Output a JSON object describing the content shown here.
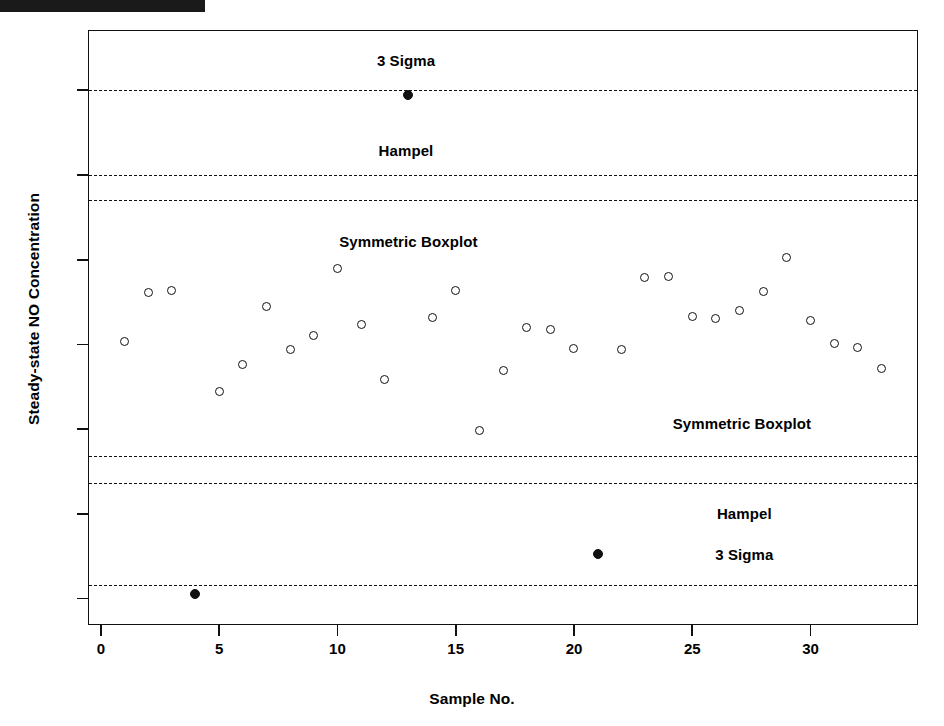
{
  "chart_data": {
    "type": "scatter",
    "title": "",
    "xlabel": "Sample No.",
    "ylabel": "Steady-state NO Concentration",
    "xlim": [
      -0.5,
      34.5
    ],
    "ylim": [
      -600,
      13400
    ],
    "xticks": [
      0,
      5,
      10,
      15,
      20,
      25,
      30
    ],
    "yticks": [
      0,
      2000,
      4000,
      6000,
      8000,
      10000,
      12000
    ],
    "grid": false,
    "legend": "none",
    "x": [
      1,
      2,
      3,
      4,
      5,
      6,
      7,
      8,
      9,
      10,
      11,
      12,
      13,
      14,
      15,
      16,
      17,
      18,
      19,
      20,
      21,
      22,
      23,
      24,
      25,
      26,
      27,
      28,
      29,
      30,
      31,
      32,
      33
    ],
    "y": [
      6080,
      7220,
      7280,
      100,
      4880,
      5530,
      6900,
      5870,
      6220,
      7800,
      6460,
      5180,
      11900,
      6640,
      7280,
      3980,
      5380,
      6390,
      6360,
      5900,
      1050,
      5880,
      7570,
      7610,
      6650,
      6620,
      6790,
      7240,
      8060,
      6560,
      6020,
      5920,
      5430
    ],
    "outliers": [
      4,
      13,
      21
    ],
    "marker_open": "open-circle",
    "marker_outlier": "filled-circle",
    "threshold_lines": [
      {
        "id": "three-sigma-upper",
        "value": 12000,
        "label": "3 Sigma",
        "side": "upper",
        "style": "dashed"
      },
      {
        "id": "hampel-upper",
        "value": 10000,
        "label": "Hampel",
        "side": "upper",
        "style": "dashed"
      },
      {
        "id": "symmetric-boxplot-upper",
        "value": 9400,
        "label": "Symmetric Boxplot",
        "side": "upper",
        "style": "dashed"
      },
      {
        "id": "symmetric-boxplot-lower",
        "value": 3360,
        "label": "Symmetric Boxplot",
        "side": "lower",
        "style": "dashed"
      },
      {
        "id": "hampel-lower",
        "value": 2720,
        "label": "Hampel",
        "side": "lower",
        "style": "dashed"
      },
      {
        "id": "three-sigma-lower",
        "value": 330,
        "label": "3 Sigma",
        "side": "lower",
        "style": "dashed"
      }
    ],
    "annotations": [
      {
        "text": "3 Sigma",
        "x": 12.9,
        "y": 12680
      },
      {
        "text": "Hampel",
        "x": 12.9,
        "y": 10560
      },
      {
        "text": "Symmetric Boxplot",
        "x": 13.0,
        "y": 8430
      },
      {
        "text": "Symmetric Boxplot",
        "x": 27.1,
        "y": 4130
      },
      {
        "text": "Hampel",
        "x": 27.2,
        "y": 2000
      },
      {
        "text": "3 Sigma",
        "x": 27.2,
        "y": 1030
      }
    ]
  },
  "axes": {
    "y_title": "Steady-state NO Concentration",
    "x_title": "Sample No.",
    "y_tick_labels": [
      "0",
      "2000",
      "4000",
      "6000",
      "8000",
      "10000",
      "12000"
    ],
    "x_tick_labels": [
      "0",
      "5",
      "10",
      "15",
      "20",
      "25",
      "30"
    ]
  },
  "colors": {
    "ink": "#111111",
    "background": "#ffffff",
    "marker_fill": "#ffffff",
    "outlier_fill": "#111111"
  }
}
